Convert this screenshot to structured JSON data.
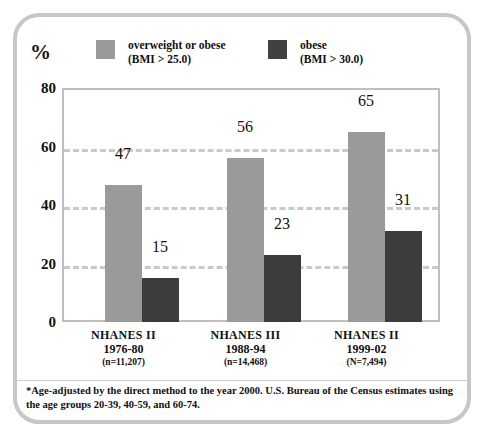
{
  "chart": {
    "axis_unit_label": "%",
    "legend": [
      {
        "name": "overweight-or-obese",
        "line1": "overweight or obese",
        "line2": "(BMI > 25.0)",
        "color": "#9a9a9a"
      },
      {
        "name": "obese",
        "line1": "obese",
        "line2": "(BMI > 30.0)",
        "color": "#3c3c3c"
      }
    ],
    "footnote": "*Age-adjusted by the direct method to the year 2000. U.S. Bureau of the Census estimates using the age groups 20-39, 40-59, and 60-74."
  },
  "chart_data": {
    "type": "bar",
    "title": "",
    "xlabel": "",
    "ylabel": "%",
    "ylim": [
      0,
      80
    ],
    "yticks": [
      0,
      20,
      40,
      60,
      80
    ],
    "gridlines": [
      20,
      40,
      60
    ],
    "grid": true,
    "legend_position": "top",
    "categories": [
      "NHANES II",
      "NHANES III",
      "NHANES II"
    ],
    "category_labels": [
      {
        "survey": "NHANES II",
        "years": "1976-80",
        "sample": "(n=11,207)"
      },
      {
        "survey": "NHANES III",
        "years": "1988-94",
        "sample": "(n=14,468)"
      },
      {
        "survey": "NHANES II",
        "years": "1999-02",
        "sample": "(N=7,494)"
      }
    ],
    "series": [
      {
        "name": "overweight or obese (BMI > 25.0)",
        "color": "#9a9a9a",
        "values": [
          47,
          56,
          65
        ]
      },
      {
        "name": "obese (BMI > 30.0)",
        "color": "#3c3c3c",
        "values": [
          15,
          23,
          31
        ]
      }
    ]
  }
}
